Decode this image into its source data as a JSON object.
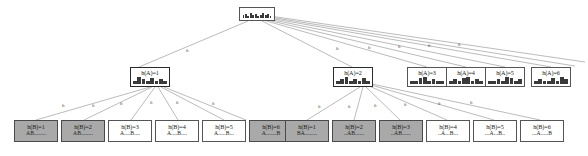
{
  "diagram": {
    "root": {
      "name": "root-node",
      "label": "",
      "sparkline": [
        3,
        4,
        2,
        5,
        3,
        4,
        2,
        3,
        5,
        3,
        4,
        2
      ]
    },
    "level1_label_prefix": "h(A)=",
    "level1": [
      {
        "id": "hA1",
        "label": "h(A)=1",
        "shaded": false,
        "bold": true,
        "sparkline": [
          2,
          5,
          3,
          2,
          4,
          2,
          3,
          2
        ]
      },
      {
        "id": "hA2",
        "label": "h(A)=2",
        "shaded": false,
        "bold": true,
        "sparkline": [
          2,
          3,
          5,
          2,
          3,
          2,
          4,
          2
        ]
      },
      {
        "id": "hA3",
        "label": "h(A)=3",
        "shaded": false,
        "bold": false,
        "sparkline": [
          2,
          2,
          4,
          5,
          2,
          3,
          2,
          2
        ]
      },
      {
        "id": "hA4",
        "label": "h(A)=4",
        "shaded": false,
        "bold": false,
        "sparkline": [
          2,
          3,
          2,
          4,
          5,
          2,
          3,
          2
        ]
      },
      {
        "id": "hA5",
        "label": "h(A)=5",
        "shaded": false,
        "bold": false,
        "sparkline": [
          2,
          2,
          3,
          2,
          5,
          4,
          2,
          3
        ]
      },
      {
        "id": "hA6",
        "label": "h(A)=6",
        "shaded": false,
        "bold": false,
        "sparkline": [
          2,
          3,
          2,
          2,
          4,
          2,
          5,
          3
        ]
      }
    ],
    "leaves_group_left": [
      {
        "id": "L1",
        "label": "h(B)=1",
        "sequence": "AB........",
        "shaded": true,
        "sparkline": [
          3,
          2,
          4,
          2,
          3,
          2,
          2,
          3
        ]
      },
      {
        "id": "L2",
        "label": "h(B)=2",
        "sequence": "AB........",
        "shaded": true,
        "sparkline": [
          2,
          4,
          2,
          3,
          2,
          3,
          2,
          2
        ]
      },
      {
        "id": "L3",
        "label": "h(B)=3",
        "sequence": "A....B....",
        "shaded": false,
        "sparkline": [
          2,
          3,
          2,
          4,
          2,
          2,
          3,
          2
        ]
      },
      {
        "id": "L4",
        "label": "h(B)=4",
        "sequence": "A....B....",
        "shaded": false,
        "sparkline": [
          2,
          2,
          3,
          2,
          4,
          2,
          2,
          3
        ]
      },
      {
        "id": "L5",
        "label": "h(B)=5",
        "sequence": "A.....B...",
        "shaded": false,
        "sparkline": [
          3,
          2,
          2,
          3,
          2,
          4,
          2,
          2
        ]
      },
      {
        "id": "L6",
        "label": "h(B)=6",
        "sequence": "A.......B",
        "shaded": true,
        "sparkline": [
          2,
          3,
          2,
          2,
          3,
          2,
          4,
          2
        ]
      }
    ],
    "leaves_group_right": [
      {
        "id": "R1",
        "label": "h(B)=1",
        "sequence": "BA........",
        "shaded": true,
        "sparkline": [
          3,
          2,
          4,
          2,
          2,
          3,
          2,
          2
        ]
      },
      {
        "id": "R2",
        "label": "h(B)=2",
        "sequence": "..AB......",
        "shaded": true,
        "sparkline": [
          2,
          4,
          2,
          2,
          3,
          2,
          3,
          2
        ]
      },
      {
        "id": "R3",
        "label": "h(B)=3",
        "sequence": "..AB......",
        "shaded": true,
        "sparkline": [
          2,
          2,
          4,
          3,
          2,
          2,
          3,
          2
        ]
      },
      {
        "id": "R4",
        "label": "h(B)=4",
        "sequence": "..A...B...",
        "shaded": false,
        "sparkline": [
          2,
          3,
          2,
          4,
          2,
          3,
          2,
          2
        ]
      },
      {
        "id": "R5",
        "label": "h(B)=5",
        "sequence": "...A...B..",
        "shaded": false,
        "sparkline": [
          2,
          2,
          3,
          2,
          4,
          2,
          3,
          2
        ]
      },
      {
        "id": "R6",
        "label": "h(B)=6",
        "sequence": "...A.....B",
        "shaded": false,
        "sparkline": [
          3,
          2,
          2,
          3,
          2,
          4,
          2,
          3
        ]
      }
    ],
    "edge_labels_level1": [
      "h",
      "h",
      "h",
      "h",
      "h",
      "h"
    ],
    "edge_labels_leaves_left": [
      "h",
      "h",
      "h",
      "h",
      "h",
      "h"
    ],
    "edge_labels_leaves_right": [
      "h",
      "h",
      "h",
      "h",
      "h",
      "h"
    ],
    "colors": {
      "shade": "#a9a9a9",
      "border": "#555555",
      "border_bold": "#2b2b2b",
      "edge": "#8d8d8d",
      "background": "#ffffff",
      "text": "#1a1a1a"
    }
  }
}
